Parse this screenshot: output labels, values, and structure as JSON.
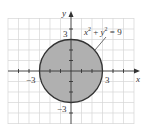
{
  "diagram": {
    "equation": "x² + y² = 9",
    "equation_parts": {
      "x": "x",
      "sup1": "2",
      "plus": " + ",
      "y": "y",
      "sup2": "2",
      "eq": " = 9"
    },
    "axes": {
      "x_label": "x",
      "y_label": "y"
    },
    "ticks": {
      "x_neg": "−3",
      "x_pos": "3",
      "y_pos": "3",
      "y_neg": "−3"
    },
    "circle": {
      "center": [
        0,
        0
      ],
      "radius": 3,
      "fill": "#b3b3b3",
      "stroke": "#333333"
    },
    "grid_color": "#d0d0d0"
  }
}
